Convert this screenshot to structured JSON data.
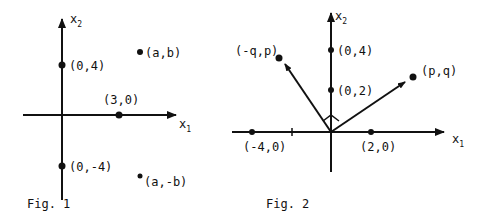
{
  "fig1": {
    "caption": "Fig. 1",
    "axis_x_label": "x",
    "axis_x_sub": "1",
    "axis_y_label": "x",
    "axis_y_sub": "2",
    "points": [
      {
        "label": "(0,4)"
      },
      {
        "label": "(3,0)"
      },
      {
        "label": "(0,-4)"
      },
      {
        "label": "(a,b)"
      },
      {
        "label": "(a,-b)"
      }
    ]
  },
  "fig2": {
    "caption": "Fig. 2",
    "axis_x_label": "x",
    "axis_x_sub": "1",
    "axis_y_label": "x",
    "axis_y_sub": "2",
    "points": [
      {
        "label": "(0,4)"
      },
      {
        "label": "(0,2)"
      },
      {
        "label": "(2,0)"
      },
      {
        "label": "(-4,0)"
      },
      {
        "label": "(p,q)"
      },
      {
        "label": "(-q,p)"
      }
    ]
  },
  "colors": {
    "ink": "#111111",
    "background": "#ffffff"
  }
}
